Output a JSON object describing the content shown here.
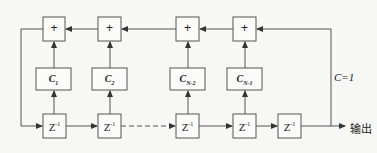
{
  "diagram": {
    "title": "",
    "adders": [
      {
        "id": "adder-1",
        "label": "+"
      },
      {
        "id": "adder-2",
        "label": "+"
      },
      {
        "id": "adder-3",
        "label": "+"
      },
      {
        "id": "adder-4",
        "label": "+"
      }
    ],
    "coefficients": [
      {
        "id": "c1",
        "base": "C",
        "sub": "1"
      },
      {
        "id": "c2",
        "base": "C",
        "sub": "2"
      },
      {
        "id": "cn2",
        "base": "C",
        "sub": "N-2"
      },
      {
        "id": "cn1",
        "base": "C",
        "sub": "N-1"
      }
    ],
    "delays": [
      {
        "id": "z1",
        "base": "Z",
        "sup": "-1"
      },
      {
        "id": "z2",
        "base": "Z",
        "sup": "-1"
      },
      {
        "id": "z3",
        "base": "Z",
        "sup": "-1"
      },
      {
        "id": "z4",
        "base": "Z",
        "sup": "-1"
      },
      {
        "id": "z5",
        "base": "Z",
        "sup": "-1"
      }
    ],
    "feedback_label": "C=1",
    "output_label": "输出",
    "edges": [
      {
        "from": "z1",
        "to": "z2",
        "style": "solid"
      },
      {
        "from": "z2",
        "to": "z3",
        "style": "dashed"
      },
      {
        "from": "z3",
        "to": "z4",
        "style": "solid"
      },
      {
        "from": "z4",
        "to": "z5",
        "style": "solid"
      },
      {
        "from": "z5",
        "to": "output",
        "style": "solid"
      },
      {
        "from": "z5",
        "to": "adder-4",
        "style": "solid",
        "note": "feedback C=1"
      },
      {
        "from": "z1",
        "to": "c1"
      },
      {
        "from": "c1",
        "to": "adder-1"
      },
      {
        "from": "z2",
        "to": "c2"
      },
      {
        "from": "c2",
        "to": "adder-2"
      },
      {
        "from": "z3",
        "to": "cn2"
      },
      {
        "from": "cn2",
        "to": "adder-3"
      },
      {
        "from": "z4",
        "to": "cn1"
      },
      {
        "from": "cn1",
        "to": "adder-4"
      },
      {
        "from": "adder-4",
        "to": "adder-3"
      },
      {
        "from": "adder-3",
        "to": "adder-2"
      },
      {
        "from": "adder-2",
        "to": "adder-1"
      },
      {
        "from": "adder-1",
        "to": "z1",
        "style": "solid"
      }
    ]
  }
}
